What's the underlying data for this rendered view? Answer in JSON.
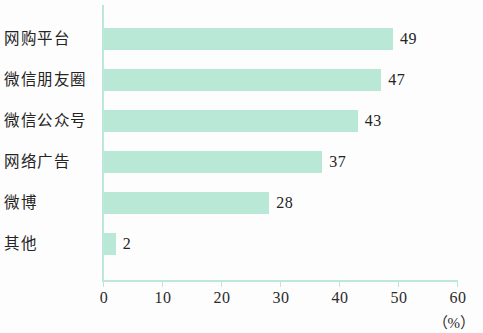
{
  "chart_data": {
    "type": "bar",
    "orientation": "horizontal",
    "title": "",
    "subtitle": "",
    "xlabel": "（%）",
    "ylabel": "",
    "categories": [
      "网购平台",
      "微信朋友圈",
      "微信公众号",
      "网络广告",
      "微博",
      "其他"
    ],
    "values": [
      49,
      47,
      43,
      37,
      28,
      2
    ],
    "value_labels": [
      "49",
      "47",
      "43",
      "37",
      "28",
      "2"
    ],
    "xlim": [
      0,
      60
    ],
    "xticks": [
      0,
      10,
      20,
      30,
      40,
      50,
      60
    ],
    "xtick_labels": [
      "0",
      "10",
      "20",
      "30",
      "40",
      "50",
      "60"
    ],
    "grid": false,
    "legend": false,
    "series": [
      {
        "name": "",
        "values": [
          49,
          47,
          43,
          37,
          28,
          2
        ]
      }
    ],
    "colors": {
      "bar": "#b9e8d6",
      "axis": "#bfe6da",
      "text": "#242424",
      "background": "#fdfdfd"
    }
  },
  "axis": {
    "unit_label": "（%）"
  }
}
